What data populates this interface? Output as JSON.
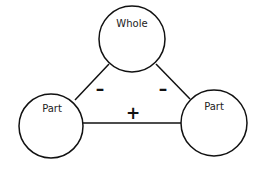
{
  "diagram": {
    "nodes": [
      {
        "id": "whole",
        "label": "Whole"
      },
      {
        "id": "part_left",
        "label": "Part"
      },
      {
        "id": "part_right",
        "label": "Part"
      }
    ],
    "edges": [
      {
        "from": "whole",
        "to": "part_left",
        "sign": "–"
      },
      {
        "from": "whole",
        "to": "part_right",
        "sign": "–"
      },
      {
        "from": "part_left",
        "to": "part_right",
        "sign": "+"
      }
    ]
  }
}
